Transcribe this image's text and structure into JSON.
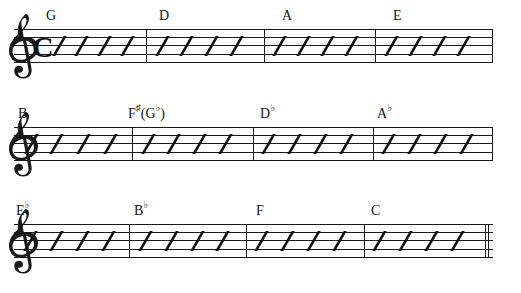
{
  "document": {
    "title": "Rhythm Slash Chord Chart",
    "notation_type": "rhythm-slash-staff",
    "clef": "treble-clef",
    "time_signature": "C",
    "time_signature_meaning": "common-time",
    "systems_count": 3,
    "measures_per_system": 4,
    "slashes_per_measure": 4,
    "final_barline": "thin-double"
  },
  "colors": {
    "ink": "#1a1a1a",
    "note_ink": "#111111",
    "text": "#141414",
    "paper": "#ffffff"
  },
  "systems": [
    {
      "index": 1,
      "staff_top": 29,
      "has_clef": true,
      "has_timesig": true,
      "measures": [
        {
          "chord": {
            "root": "G",
            "accidental": ""
          },
          "slashes": 4
        },
        {
          "chord": {
            "root": "D",
            "accidental": ""
          },
          "slashes": 4
        },
        {
          "chord": {
            "root": "A",
            "accidental": ""
          },
          "slashes": 4
        },
        {
          "chord": {
            "root": "E",
            "accidental": ""
          },
          "slashes": 4
        }
      ]
    },
    {
      "index": 2,
      "staff_top": 127,
      "has_clef": true,
      "has_timesig": false,
      "measures": [
        {
          "chord": {
            "root": "B",
            "accidental": ""
          },
          "slashes": 4
        },
        {
          "chord": {
            "root": "F",
            "accidental": "♯",
            "alt_open": "(G",
            "alt_accidental": "♭",
            "alt_close": ")"
          },
          "slashes": 4
        },
        {
          "chord": {
            "root": "D",
            "accidental": "♭"
          },
          "slashes": 4
        },
        {
          "chord": {
            "root": "A",
            "accidental": "♭"
          },
          "slashes": 4
        }
      ]
    },
    {
      "index": 3,
      "staff_top": 224,
      "has_clef": true,
      "has_timesig": false,
      "measures": [
        {
          "chord": {
            "root": "E",
            "accidental": "♭"
          },
          "slashes": 4
        },
        {
          "chord": {
            "root": "B",
            "accidental": "♭"
          },
          "slashes": 4
        },
        {
          "chord": {
            "root": "F",
            "accidental": ""
          },
          "slashes": 4
        },
        {
          "chord": {
            "root": "C",
            "accidental": ""
          },
          "slashes": 4
        }
      ]
    }
  ],
  "chord_labels": {
    "system1": [
      "G",
      "D",
      "A",
      "E"
    ],
    "system2": [
      "B",
      "F♯(G♭)",
      "D♭",
      "A♭"
    ],
    "system3": [
      "E♭",
      "B♭",
      "F",
      "C"
    ]
  },
  "layout": {
    "system1": {
      "barlines_x": [
        146,
        264,
        375
      ],
      "chord_x": [
        46,
        159,
        282,
        393
      ],
      "chord_y": 8,
      "measure_starts": [
        36,
        152,
        270,
        381
      ],
      "measure_ends": [
        146,
        264,
        375,
        492
      ]
    },
    "system2": {
      "barlines_x": [
        132,
        253,
        373
      ],
      "chord_x": [
        18,
        128,
        260,
        377
      ],
      "chord_y": 106,
      "measure_starts": [
        18,
        138,
        259,
        379
      ],
      "measure_ends": [
        132,
        253,
        373,
        492
      ]
    },
    "system3": {
      "barlines_x": [
        129,
        246,
        364
      ],
      "chord_x": [
        16,
        134,
        256,
        371
      ],
      "chord_y": 204,
      "measure_starts": [
        18,
        135,
        252,
        370
      ],
      "measure_ends": [
        129,
        246,
        364,
        488
      ],
      "final_bar_x": 488
    }
  }
}
